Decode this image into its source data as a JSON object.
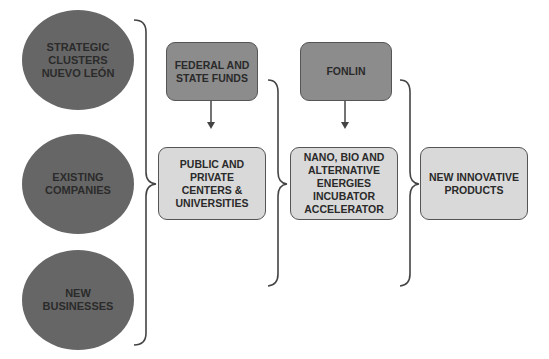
{
  "diagram": {
    "sources": [
      {
        "label": "STRATEGIC\nCLUSTERS\nNUEVO LEÓN"
      },
      {
        "label": "EXISTING\nCOMPANIES"
      },
      {
        "label": "NEW\nBUSINESSES"
      }
    ],
    "funding": [
      {
        "label": "FEDERAL AND\nSTATE FUNDS"
      },
      {
        "label": "FONLIN"
      }
    ],
    "stages": [
      {
        "label": "PUBLIC AND\nPRIVATE\nCENTERS &\nUNIVERSITIES"
      },
      {
        "label": "NANO, BIO AND\nALTERNATIVE\nENERGIES\nINCUBATOR\nACCELERATOR"
      },
      {
        "label": "NEW INNOVATIVE\nPRODUCTS"
      }
    ],
    "colors": {
      "ellipse": "#666666",
      "dark_box": "#8c8c8c",
      "light_box": "#d9d9d9",
      "line": "#444444"
    }
  }
}
